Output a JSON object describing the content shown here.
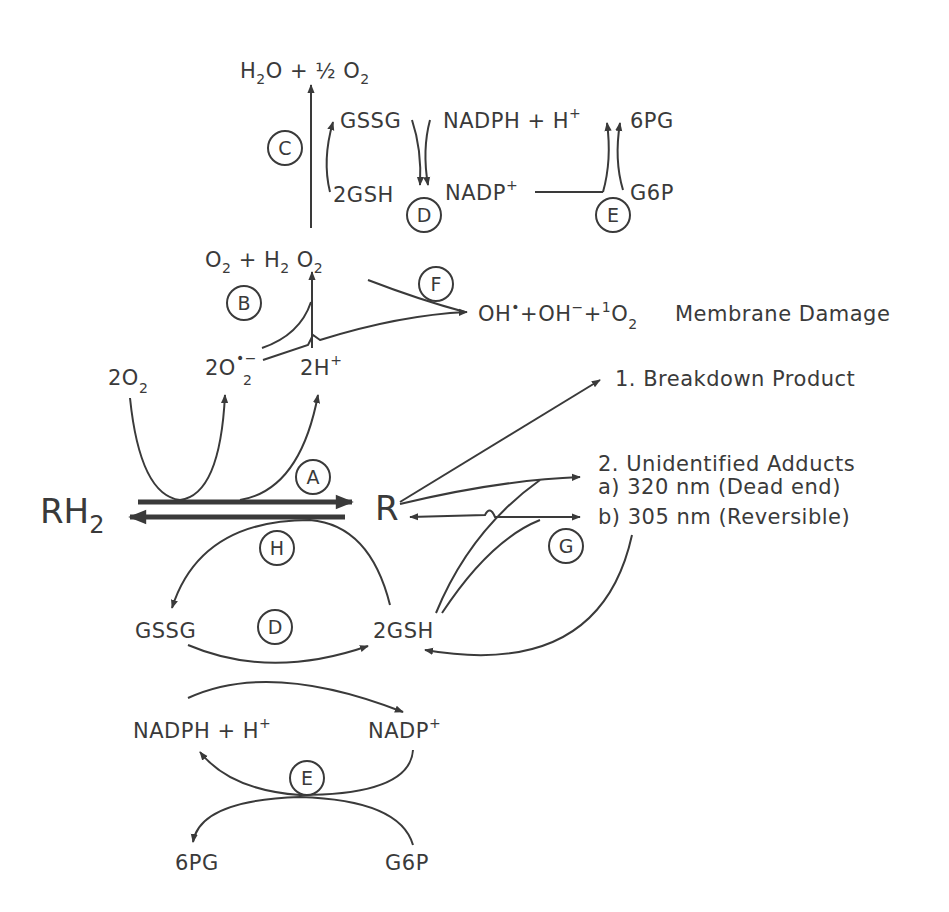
{
  "diagram": {
    "type": "metabolic-pathway",
    "top_cycle": {
      "product": "H2O + ½O2",
      "enzymes": {
        "C": "C",
        "D": "D",
        "E": "E"
      },
      "gssg": "GSSG",
      "gsh": "2GSH",
      "nadph": "NADPH + H+",
      "nadp": "NADP+",
      "pg6": "6PG",
      "g6p": "G6P"
    },
    "middle": {
      "o2_h2o2": "O2 + H2O2",
      "enzyme_b": "B",
      "enzyme_f": "F",
      "two_o2": "2O2",
      "superoxide": "2O2•−",
      "two_h": "2H+",
      "radicals": "OH• + OH− + ¹O2",
      "membrane_damage": "Membrane Damage"
    },
    "main_reaction": {
      "substrate": "RH2",
      "product": "R",
      "enzyme_a": "A",
      "enzyme_h": "H",
      "enzyme_g": "G"
    },
    "products": {
      "breakdown": "1. Breakdown Product",
      "adducts_title": "2. Unidentified Adducts",
      "adduct_a": "a) 320 nm   (Dead end)",
      "adduct_b": "b) 305 nm   (Reversible)"
    },
    "bottom_cycle": {
      "gssg": "GSSG",
      "gsh": "2GSH",
      "enzyme_d": "D",
      "nadph": "NADPH + H+",
      "nadp": "NADP+",
      "enzyme_e": "E",
      "pg6": "6PG",
      "g6p": "G6P"
    }
  }
}
